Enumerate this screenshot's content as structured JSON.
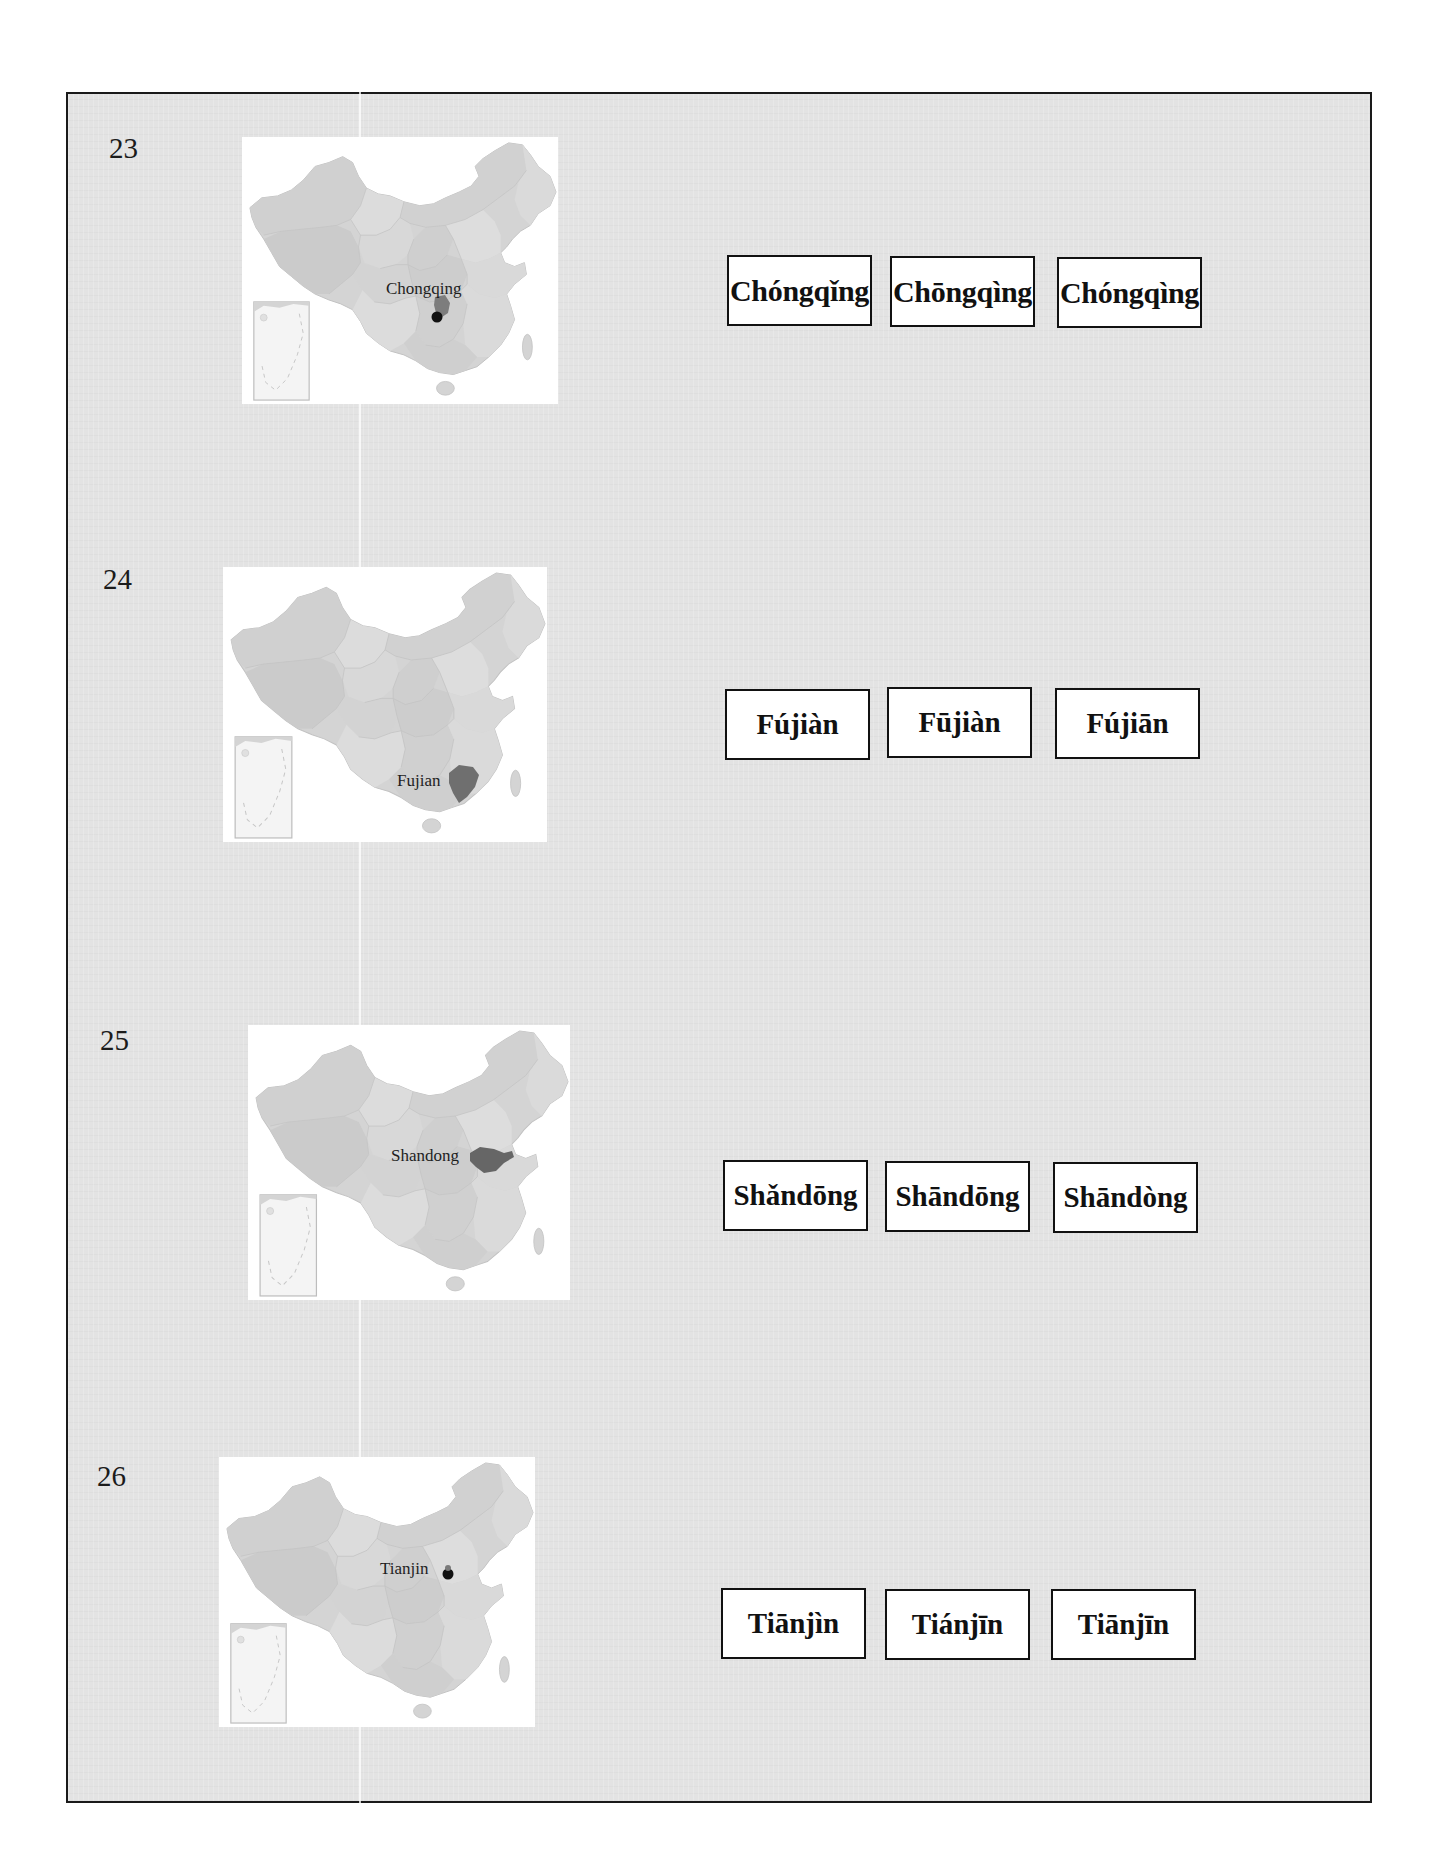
{
  "worksheet": {
    "questions": [
      {
        "number": "23",
        "map_label": "Chongqing",
        "choices": [
          "Chóngqǐng",
          "Chōngqìng",
          "Chóngqìng"
        ]
      },
      {
        "number": "24",
        "map_label": "Fujian",
        "choices": [
          "Fújiàn",
          "Fūjiàn",
          "Fújiān"
        ]
      },
      {
        "number": "25",
        "map_label": "Shandong",
        "choices": [
          "Shǎndōng",
          "Shāndōng",
          "Shāndòng"
        ]
      },
      {
        "number": "26",
        "map_label": "Tianjin",
        "choices": [
          "Tiānjìn",
          "Tiánjīn",
          "Tiānjīn"
        ]
      }
    ]
  },
  "colors": {
    "sheet_background": "#e3e3e3",
    "map_land": "#d6d6d6",
    "map_highlight": "#7a7a7a",
    "marker": "#111111",
    "border": "#111111"
  }
}
